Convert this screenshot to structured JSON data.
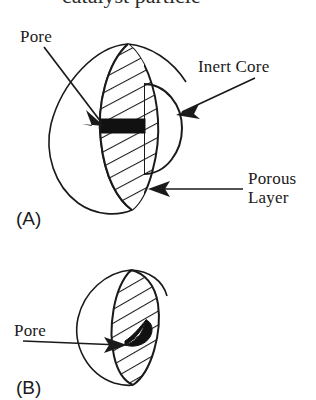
{
  "figure": {
    "background_color": "#ffffff",
    "ink_color": "#1a1a1a",
    "pore_fill_color": "#111111",
    "cropped_caption_top": "catalyst particle",
    "panels": [
      {
        "id": "A",
        "panel_label": "(A)",
        "annotations": [
          {
            "key": "pore",
            "label": "Pore"
          },
          {
            "key": "inert_core",
            "label": "Inert Core"
          },
          {
            "key": "porous_layer_line1",
            "label": "Porous"
          },
          {
            "key": "porous_layer_line2",
            "label": "Layer"
          }
        ]
      },
      {
        "id": "B",
        "panel_label": "(B)",
        "annotations": [
          {
            "key": "pore",
            "label": "Pore"
          }
        ]
      }
    ]
  },
  "labels": {
    "pore_a": "Pore",
    "inert_core": "Inert Core",
    "porous_line1": "Porous",
    "porous_line2": "Layer",
    "panel_a": "(A)",
    "pore_b": "Pore",
    "panel_b": "(B)"
  }
}
